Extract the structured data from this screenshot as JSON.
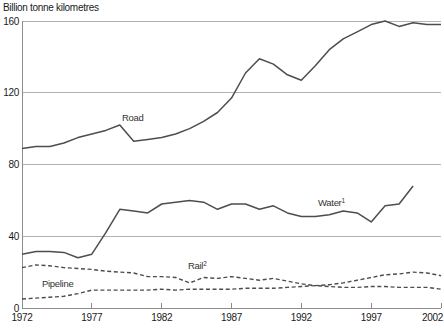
{
  "chart_data": {
    "type": "line",
    "title": "Billion tonne kilometres",
    "xlabel": "",
    "ylabel": "Billion tonne kilometres",
    "xlim": [
      1972,
      2002
    ],
    "ylim": [
      0,
      160
    ],
    "xticks": [
      1972,
      1977,
      1982,
      1987,
      1992,
      1997,
      2002
    ],
    "yticks": [
      0,
      40,
      80,
      120,
      160
    ],
    "grid": "horizontal gridlines at each y tick",
    "legend": "inline labels next to each line",
    "colors": {
      "line": "#4d4d4d",
      "grid": "#b3b3b3",
      "axis": "#8c8c8c",
      "text": "#1f1f1f",
      "background": "#ffffff"
    },
    "series": [
      {
        "name": "Road",
        "label": "Road",
        "footnote_sup": "",
        "style": "solid",
        "start_year": 1972,
        "values": [
          89,
          90,
          90,
          92,
          95,
          97,
          99,
          102,
          93,
          94,
          95,
          97,
          100,
          104,
          109,
          117,
          131,
          139,
          136,
          130,
          127,
          135,
          144,
          150,
          154,
          158,
          160,
          157,
          159,
          158,
          158
        ]
      },
      {
        "name": "Water",
        "label": "Water",
        "footnote_sup": "1",
        "style": "solid",
        "start_year": 1972,
        "values": [
          30,
          31.5,
          31.5,
          31,
          28,
          30,
          42,
          55,
          54,
          53,
          58,
          59,
          60,
          59,
          55,
          58,
          58,
          55,
          57,
          53,
          51,
          51,
          52,
          54,
          53,
          48,
          57,
          58,
          68
        ]
      },
      {
        "name": "Rail",
        "label": "Rail",
        "footnote_sup": "2",
        "style": "dashed",
        "start_year": 1972,
        "values": [
          22.5,
          24,
          23.5,
          22.5,
          22,
          21.5,
          20.5,
          20,
          19.5,
          17.5,
          17.5,
          17,
          14,
          17,
          16.5,
          17.5,
          16.5,
          15.5,
          16.5,
          15,
          13.5,
          12.5,
          13,
          14,
          15.5,
          17,
          18.5,
          19,
          20,
          19.5,
          18
        ]
      },
      {
        "name": "Pipeline",
        "label": "Pipeline",
        "footnote_sup": "",
        "style": "dashed",
        "start_year": 1972,
        "values": [
          5,
          5.5,
          6,
          6.5,
          8,
          10,
          10,
          10,
          10,
          10,
          10.5,
          10,
          10.5,
          10.5,
          10.5,
          10.5,
          11,
          11,
          11,
          11.5,
          12,
          12.5,
          12,
          11.5,
          11.5,
          12,
          12,
          11.5,
          11.5,
          11.5,
          10.5
        ]
      }
    ]
  }
}
